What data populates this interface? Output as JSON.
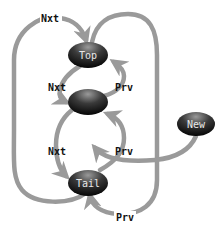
{
  "diagram": {
    "title": "",
    "colors": {
      "edge": "#9a9a9a",
      "node_top": "#8a8a8a",
      "node_bottom": "#0a0a0a",
      "node_text": "#e8e8e8",
      "label_text": "#111111"
    },
    "nodes": [
      {
        "id": "top",
        "label": "Top"
      },
      {
        "id": "middle",
        "label": ""
      },
      {
        "id": "tail",
        "label": "Tail"
      },
      {
        "id": "new",
        "label": "New"
      }
    ],
    "edges": [
      {
        "from": "tail",
        "to": "top",
        "label": "Nxt"
      },
      {
        "from": "top",
        "to": "middle",
        "label": "Nxt"
      },
      {
        "from": "middle",
        "to": "top",
        "label": "Prv"
      },
      {
        "from": "middle",
        "to": "tail",
        "label": "Nxt"
      },
      {
        "from": "tail",
        "to": "middle",
        "label": "Prv"
      },
      {
        "from": "top",
        "to": "tail",
        "label": "Prv"
      },
      {
        "from": "new",
        "to": "middle",
        "label": ""
      }
    ]
  }
}
